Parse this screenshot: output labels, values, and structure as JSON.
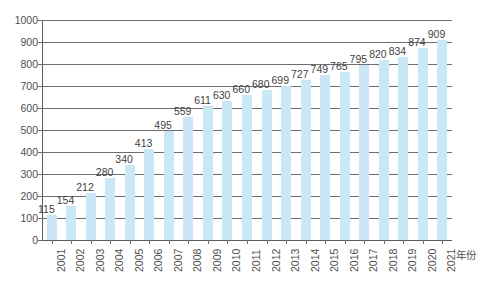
{
  "chart_data": {
    "type": "bar",
    "title": "",
    "subtitle": "",
    "xlabel": "年份",
    "ylabel": "",
    "categories": [
      "2001",
      "2002",
      "2003",
      "2004",
      "2005",
      "2006",
      "2007",
      "2008",
      "2009",
      "2010",
      "2011",
      "2012",
      "2013",
      "2014",
      "2015",
      "2016",
      "2017",
      "2018",
      "2019",
      "2020",
      "2021"
    ],
    "values": [
      115,
      154,
      212,
      280,
      340,
      413,
      495,
      559,
      611,
      630,
      660,
      680,
      699,
      727,
      749,
      765,
      795,
      820,
      834,
      874,
      909
    ],
    "ylim": [
      0,
      1000
    ],
    "yticks": [
      0,
      100,
      200,
      300,
      400,
      500,
      600,
      700,
      800,
      900,
      1000
    ],
    "ytick_labels": [
      "0",
      "100",
      "200",
      "300",
      "400",
      "500",
      "600",
      "700",
      "800",
      "900",
      "1000"
    ],
    "grid": true,
    "grid_axis": "y",
    "legend": "none",
    "bar_color": "#c9e7f5",
    "axis_color": "#6e6e6e",
    "text_color": "#4f4f4f",
    "data_labels_shown": true
  },
  "caption": {
    "bottom_partial_text": ""
  }
}
